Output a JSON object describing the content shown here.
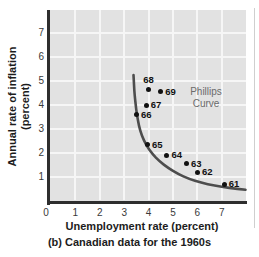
{
  "figure": {
    "ylabel_line1": "Annual rate of inflation",
    "ylabel_line2": "(percent)",
    "xlabel": "Unemployment rate (percent)",
    "caption": "(b) Canadian data for the 1960s",
    "annotation_line1": "Phillips",
    "annotation_line2": "Curve"
  },
  "chart_data": {
    "type": "scatter",
    "title": "",
    "xlabel": "Unemployment rate (percent)",
    "ylabel": "Annual rate of inflation (percent)",
    "caption": "(b) Canadian data for the 1960s",
    "annotation": "Phillips Curve",
    "xlim": [
      0,
      7.95
    ],
    "ylim": [
      0,
      7.95
    ],
    "x_ticks": [
      0,
      1,
      2,
      3,
      4,
      5,
      6,
      7
    ],
    "y_ticks": [
      1,
      2,
      3,
      4,
      5,
      6,
      7
    ],
    "grid": true,
    "points": [
      {
        "label": "61",
        "x": 7.1,
        "y": 0.7,
        "label_position": "right"
      },
      {
        "label": "62",
        "x": 6.0,
        "y": 1.2,
        "label_position": "right"
      },
      {
        "label": "63",
        "x": 5.55,
        "y": 1.55,
        "label_position": "right"
      },
      {
        "label": "64",
        "x": 4.75,
        "y": 1.9,
        "label_position": "right"
      },
      {
        "label": "65",
        "x": 3.95,
        "y": 2.35,
        "label_position": "right"
      },
      {
        "label": "66",
        "x": 3.5,
        "y": 3.6,
        "label_position": "right"
      },
      {
        "label": "67",
        "x": 3.9,
        "y": 4.0,
        "label_position": "right"
      },
      {
        "label": "68",
        "x": 4.0,
        "y": 4.65,
        "label_position": "above"
      },
      {
        "label": "69",
        "x": 4.5,
        "y": 4.55,
        "label_position": "right"
      }
    ],
    "curve": {
      "name": "Phillips Curve",
      "points": [
        [
          3.38,
          5.25
        ],
        [
          3.4,
          4.85
        ],
        [
          3.43,
          4.4
        ],
        [
          3.47,
          4.0
        ],
        [
          3.52,
          3.6
        ],
        [
          3.6,
          3.15
        ],
        [
          3.72,
          2.72
        ],
        [
          3.9,
          2.33
        ],
        [
          4.15,
          1.97
        ],
        [
          4.45,
          1.65
        ],
        [
          4.8,
          1.38
        ],
        [
          5.2,
          1.13
        ],
        [
          5.65,
          0.92
        ],
        [
          6.15,
          0.76
        ],
        [
          6.7,
          0.64
        ],
        [
          7.3,
          0.54
        ],
        [
          7.97,
          0.47
        ]
      ]
    }
  },
  "colors": {
    "plot_bg": "#e2e2e2",
    "grid": "#f6f6f6",
    "axis": "#2e2e2e",
    "curve": "#4d4d4d",
    "point": "#111111",
    "annotation_text": "#6b6b6b",
    "tick_text": "#3a3a3a",
    "text": "#1c1c1c"
  }
}
